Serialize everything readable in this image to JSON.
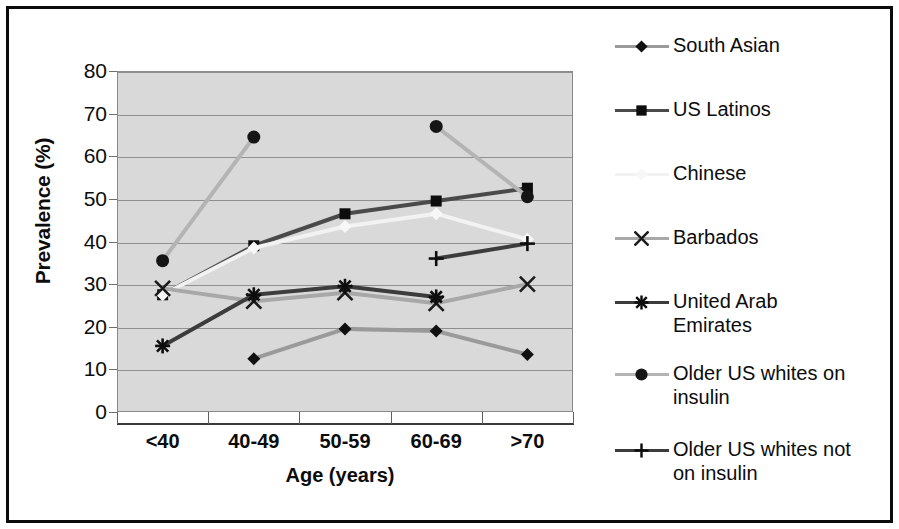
{
  "chart_data": {
    "type": "line",
    "title": "",
    "xlabel": "Age (years)",
    "ylabel": "Prevalence (%)",
    "categories": [
      "<40",
      "40-49",
      "50-59",
      "60-69",
      ">70"
    ],
    "ylim": [
      0,
      80
    ],
    "ytick_labels": [
      "0",
      "10",
      "20",
      "30",
      "40",
      "50",
      "60",
      "70",
      "80"
    ],
    "ytick_values": [
      0,
      10,
      20,
      30,
      40,
      50,
      60,
      70,
      80
    ],
    "grid": true,
    "legend_position": "right",
    "plot_background": "#d9d9d9",
    "series": [
      {
        "name": "South Asian",
        "marker": "diamond",
        "color": "#9a9a9a",
        "marker_color": "#101010",
        "values": [
          null,
          12.5,
          19.5,
          19.0,
          13.5
        ]
      },
      {
        "name": "US Latinos",
        "marker": "square",
        "color": "#4a4a4a",
        "marker_color": "#0d0d0d",
        "values": [
          27.5,
          39.0,
          46.5,
          49.5,
          52.5
        ]
      },
      {
        "name": "Chinese",
        "marker": "diamond",
        "color": "#f2f2f2",
        "marker_color": "#f7f7f7",
        "values": [
          27.5,
          38.5,
          43.5,
          46.5,
          40.5
        ]
      },
      {
        "name": "Barbados",
        "marker": "x",
        "color": "#a8a8a8",
        "marker_color": "#1a1a1a",
        "values": [
          29.0,
          26.0,
          28.0,
          25.5,
          30.0
        ]
      },
      {
        "name": "United Arab Emirates",
        "marker": "asterisk",
        "color": "#3c3c3c",
        "marker_color": "#0d0d0d",
        "values": [
          15.5,
          27.5,
          29.5,
          27.0,
          null
        ]
      },
      {
        "name": "Older US whites on insulin",
        "marker": "circle",
        "color": "#b4b4b4",
        "marker_color": "#151515",
        "values": [
          35.5,
          64.5,
          null,
          67.0,
          50.5
        ]
      },
      {
        "name": "Older US whites not on insulin",
        "marker": "plus",
        "color": "#3c3c3c",
        "marker_color": "#0d0d0d",
        "values": [
          null,
          null,
          null,
          36.0,
          39.5
        ]
      }
    ]
  },
  "legend": {
    "items": [
      {
        "label": "South Asian"
      },
      {
        "label": "US Latinos"
      },
      {
        "label": "Chinese"
      },
      {
        "label": "Barbados"
      },
      {
        "label": "United Arab\nEmirates"
      },
      {
        "label": "Older US whites on\ninsulin"
      },
      {
        "label": "Older US whites not\non insulin"
      }
    ]
  }
}
